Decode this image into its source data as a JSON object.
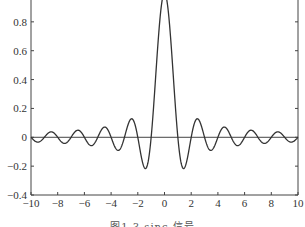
{
  "chart_data": {
    "type": "line",
    "title": "",
    "caption": "图1.3  sinc 信号",
    "xlabel": "",
    "ylabel": "",
    "function": "sinc(x) = sin(pi*x)/(pi*x)",
    "xlim": [
      -10,
      10
    ],
    "ylim": [
      -0.4,
      1.0
    ],
    "x_ticks": [
      -10,
      -8,
      -6,
      -4,
      -2,
      0,
      2,
      4,
      6,
      8,
      10
    ],
    "x_tick_labels": [
      "-10",
      "-8",
      "-6",
      "-4",
      "-2",
      "0",
      "2",
      "4",
      "6",
      "8",
      "10"
    ],
    "y_ticks": [
      -0.4,
      -0.2,
      0,
      0.2,
      0.4,
      0.6,
      0.8
    ],
    "y_tick_labels": [
      "-0.4",
      "-0.2",
      "0",
      "0.2",
      "0.4",
      "0.6",
      "0.8"
    ],
    "grid": false,
    "legend": null,
    "zero_line": true,
    "series": [
      {
        "name": "sinc",
        "color": "#333333",
        "x": [
          -10,
          -9.5,
          -9,
          -8.5,
          -8,
          -7.5,
          -7,
          -6.5,
          -6,
          -5.5,
          -5,
          -4.5,
          -4,
          -3.5,
          -3,
          -2.5,
          -2,
          -1.5,
          -1.43,
          -1,
          -0.5,
          0,
          0.5,
          1,
          1.43,
          1.5,
          2,
          2.5,
          3,
          3.5,
          4,
          4.5,
          5,
          5.5,
          6,
          6.5,
          7,
          7.5,
          8,
          8.5,
          9,
          9.5,
          10
        ],
        "values": [
          0,
          -0.034,
          0,
          0.037,
          0,
          -0.042,
          0,
          0.049,
          0,
          -0.058,
          0,
          0.071,
          0,
          -0.091,
          0,
          0.127,
          0,
          -0.212,
          -0.217,
          0,
          0.637,
          1.0,
          0.637,
          0,
          -0.217,
          -0.212,
          0,
          0.127,
          0,
          -0.091,
          0,
          0.071,
          0,
          -0.058,
          0,
          0.049,
          0,
          -0.042,
          0,
          0.037,
          0,
          -0.034,
          0
        ]
      }
    ],
    "plot_area_px": {
      "left": 31,
      "right": 298,
      "top": -7,
      "bottom": 195
    }
  }
}
